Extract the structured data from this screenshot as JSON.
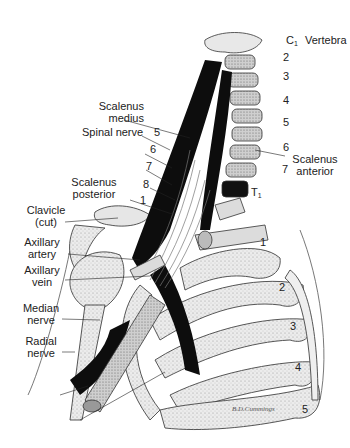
{
  "figure": {
    "signature": "B.D.Cummings",
    "colors": {
      "ink": "#1a1a1a",
      "muscle": "#0d0d0d",
      "bone": "#d9d9d9",
      "paper": "#ffffff"
    }
  },
  "labels": {
    "vertebra_c": "C",
    "vertebra_c_sub": "1",
    "vertebra": "Vertebra",
    "scalenus_medius_1": "Scalenus",
    "scalenus_medius_2": "medius",
    "spinal_nerve": "Spinal nerve",
    "scalenus_anterior_1": "Scalenus",
    "scalenus_anterior_2": "anterior",
    "scalenus_posterior_1": "Scalenus",
    "scalenus_posterior_2": "posterior",
    "clavicle_1": "Clavicle",
    "clavicle_2": "(cut)",
    "axillary_artery_1": "Axillary",
    "axillary_artery_2": "artery",
    "axillary_vein_1": "Axillary",
    "axillary_vein_2": "vein",
    "median_nerve_1": "Median",
    "median_nerve_2": "nerve",
    "radial_nerve_1": "Radial",
    "radial_nerve_2": "nerve",
    "t1": "T",
    "t1_sub": "1"
  },
  "vertebra_numbers": [
    "2",
    "3",
    "4",
    "5",
    "6",
    "7"
  ],
  "spinal_nerve_numbers": [
    "5",
    "6",
    "7",
    "8",
    "1"
  ],
  "rib_numbers": [
    "1",
    "2",
    "3",
    "4",
    "5"
  ]
}
